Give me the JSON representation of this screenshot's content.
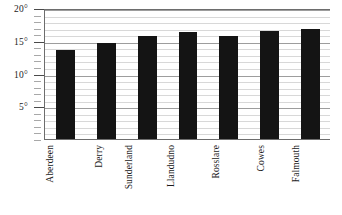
{
  "chart_data": {
    "type": "bar",
    "title": "",
    "subtitle": "",
    "xlabel": "",
    "ylabel": "",
    "categories": [
      "Aberdeen",
      "Derry",
      "Sunderland",
      "Llandudno",
      "Rosslare",
      "Cowes",
      "Falmouth"
    ],
    "values": [
      13.6,
      14.6,
      15.7,
      16.4,
      15.8,
      16.5,
      16.8
    ],
    "ylim": [
      0,
      20
    ],
    "y_major_ticks": [
      5,
      10,
      15,
      20
    ],
    "y_tick_labels": [
      "5°",
      "10°",
      "15°",
      "20°"
    ],
    "y_minor_tick_step": 1,
    "grid": true,
    "grid_axis": "y",
    "legend": null,
    "bar_color": "#141414",
    "grid_color": "#d8d8d8",
    "axis_color": "#6d6d6d",
    "background_color": "#ffffff",
    "unit": "°"
  }
}
